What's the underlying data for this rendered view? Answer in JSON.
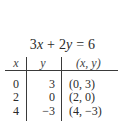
{
  "equation": {
    "lhs_coef1": "3",
    "lhs_var1": "x",
    "op": " + ",
    "lhs_coef2": "2",
    "lhs_var2": "y",
    "eq": " = ",
    "rhs": "6"
  },
  "table": {
    "headers": [
      "x",
      "y",
      "(x, y)"
    ],
    "rows": [
      [
        "0",
        "3",
        "(0, 3)"
      ],
      [
        "2",
        "0",
        "(2, 0)"
      ],
      [
        "4",
        "−3",
        "(4, −3)"
      ]
    ]
  }
}
